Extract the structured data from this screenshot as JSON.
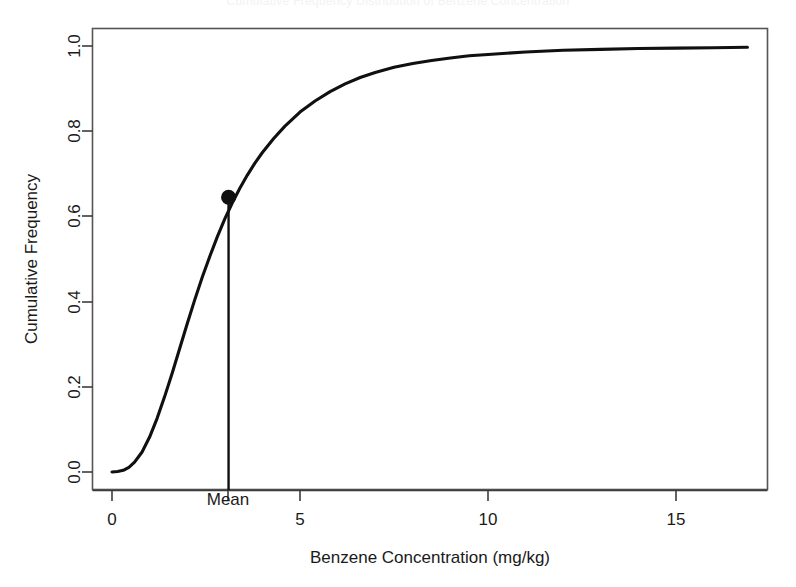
{
  "figure": {
    "title": "Cumulative Frequency Distribution of Benzene Concentration",
    "background_color": "#ffffff",
    "line_color": "#101010",
    "axis_color": "#3b3b3b"
  },
  "chart_data": {
    "type": "line",
    "title": "",
    "xlabel": "Benzene Concentration (mg/kg)",
    "ylabel": "Cumulative Frequency",
    "xlim": [
      -0.4,
      17.4
    ],
    "ylim": [
      -0.02,
      1.04
    ],
    "xticks": [
      0,
      5,
      10,
      15
    ],
    "xticklabels": [
      "0",
      "5",
      "10",
      "15"
    ],
    "yticks": [
      0.0,
      0.2,
      0.4,
      0.6,
      0.8,
      1.0
    ],
    "yticklabels": [
      "0.0",
      "0.2",
      "0.4",
      "0.6",
      "0.8",
      "1.0"
    ],
    "grid": false,
    "legend": "none",
    "series": [
      {
        "name": "Cumulative frequency curve",
        "x": [
          0.0,
          0.15,
          0.3,
          0.45,
          0.6,
          0.8,
          1.0,
          1.2,
          1.4,
          1.6,
          1.8,
          2.0,
          2.2,
          2.4,
          2.6,
          2.8,
          3.0,
          3.1,
          3.2,
          3.4,
          3.6,
          3.8,
          4.0,
          4.3,
          4.6,
          5.0,
          5.4,
          5.8,
          6.2,
          6.6,
          7.0,
          7.5,
          8.0,
          8.5,
          9.0,
          9.5,
          10.0,
          11.0,
          12.0,
          13.0,
          14.0,
          15.0,
          16.0,
          16.9
        ],
        "y": [
          0.0,
          0.001,
          0.004,
          0.011,
          0.023,
          0.047,
          0.082,
          0.126,
          0.177,
          0.232,
          0.29,
          0.348,
          0.404,
          0.457,
          0.506,
          0.552,
          0.594,
          0.613,
          0.632,
          0.666,
          0.697,
          0.725,
          0.75,
          0.783,
          0.812,
          0.845,
          0.871,
          0.893,
          0.911,
          0.926,
          0.938,
          0.95,
          0.959,
          0.966,
          0.972,
          0.977,
          0.98,
          0.986,
          0.99,
          0.992,
          0.994,
          0.995,
          0.996,
          0.997
        ]
      }
    ],
    "annotations": [
      {
        "name": "mean-marker",
        "label": "Mean",
        "x": 3.1,
        "y": 0.645,
        "type": "point-with-vertical-line"
      }
    ]
  },
  "axes": {
    "x_title": "Benzene Concentration (mg/kg)",
    "y_title": "Cumulative Frequency",
    "x_tick_0": "0",
    "x_tick_1": "5",
    "x_tick_2": "10",
    "x_tick_3": "15",
    "y_tick_0": "0.0",
    "y_tick_1": "0.2",
    "y_tick_2": "0.4",
    "y_tick_3": "0.6",
    "y_tick_4": "0.8",
    "y_tick_5": "1.0",
    "mean_label": "Mean"
  }
}
